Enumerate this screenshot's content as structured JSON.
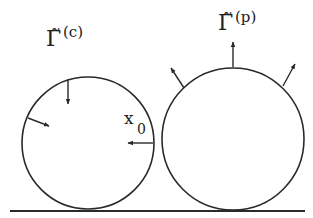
{
  "diagram": {
    "colors": {
      "stroke": "#2a2a2a",
      "background": "#ffffff"
    },
    "labels": {
      "left_gamma": "Γ̃",
      "left_sup": "(c)",
      "right_gamma": "Γ̃",
      "right_sup": "(p)",
      "x0_main": "x",
      "x0_sub": "0"
    },
    "shapes": {
      "left_circle": {
        "cx": 88,
        "cy": 143,
        "r": 66,
        "arrows": "inward"
      },
      "right_circle": {
        "cx": 233,
        "cy": 139,
        "r": 71,
        "arrows": "outward"
      },
      "baseline": {
        "y": 211,
        "x1": 10,
        "x2": 305
      }
    }
  }
}
